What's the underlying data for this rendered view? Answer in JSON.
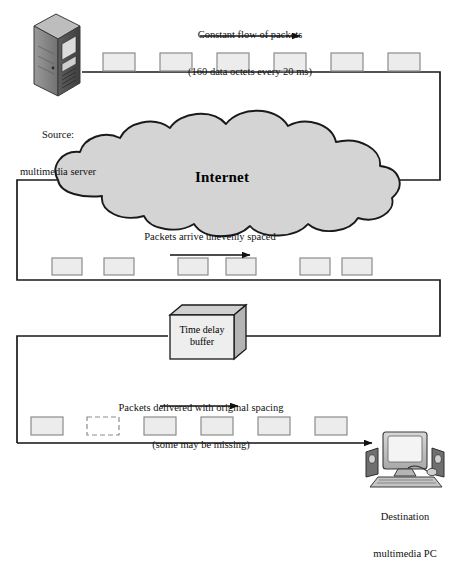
{
  "diagram": {
    "colors": {
      "line": "#1a1a1a",
      "packet_fill": "#ececec",
      "packet_stroke": "#808080",
      "cloud_fill": "#d4d4d4",
      "cloud_stroke": "#1a1a1a",
      "buffer_front": "#e8e8e8",
      "buffer_top": "#d0d0d0",
      "buffer_side": "#b8b8b8",
      "device_dark": "#4a4a4a",
      "device_mid": "#8a8a8a",
      "device_light": "#c9c9c9"
    }
  },
  "labels": {
    "top_caption_line1": "Constant flow of packets",
    "top_caption_line2": "(160 data octets every 20 ms)",
    "source_line1": "Source:",
    "source_line2": "multimedia server",
    "cloud": "Internet",
    "middle_caption": "Packets arrive unevenly spaced",
    "buffer_line1": "Time delay",
    "buffer_line2": "buffer",
    "bottom_caption_line1": "Packets delivered with original spacing",
    "bottom_caption_line2": "(some may be missing)",
    "destination_line1": "Destination",
    "destination_line2": "multimedia PC"
  },
  "packet_rows": {
    "top": {
      "name": "constant-flow-packets",
      "y": 53,
      "w": 32,
      "h": 18,
      "x_positions": [
        103,
        160,
        217,
        274,
        331,
        388
      ],
      "missing_index": null,
      "spacing": "even"
    },
    "middle": {
      "name": "unevenly-spaced-packets",
      "y": 258,
      "w": 30,
      "h": 17,
      "x_positions": [
        52,
        104,
        178,
        226,
        300,
        342
      ],
      "missing_index": null,
      "spacing": "uneven"
    },
    "bottom": {
      "name": "delivered-packets",
      "y": 417,
      "w": 32,
      "h": 18,
      "x_positions": [
        31,
        87,
        144,
        201,
        258,
        315
      ],
      "missing_index": 1,
      "spacing": "even"
    }
  },
  "arrows": [
    {
      "name": "top-flow-arrow",
      "x1": 200,
      "y1": 36,
      "x2": 300,
      "y2": 36
    },
    {
      "name": "middle-flow-arrow",
      "x1": 170,
      "y1": 255,
      "x2": 250,
      "y2": 255
    },
    {
      "name": "bottom-flow-arrow",
      "x1": 160,
      "y1": 406,
      "x2": 238,
      "y2": 406
    },
    {
      "name": "delivery-arrow-to-pc",
      "x1": 18,
      "y1": 443,
      "x2": 372,
      "y2": 443
    }
  ],
  "paths": {
    "source_to_internet": "from source, right along y=72 to x=440, down to y=180, into cloud right edge",
    "internet_to_buffer": "from cloud left edge x=60 y=180, left to x=17, down to y=280, right to x=440, down to y=336, left to buffer right face",
    "buffer_to_destination": "from buffer left face x=168 y=336, left to x=17, down to y=443, right to destination PC"
  },
  "cloud": {
    "cx": 230,
    "cy": 178,
    "left": 58,
    "right": 402,
    "top": 136,
    "bottom": 220
  },
  "buffer_box": {
    "x": 170,
    "y": 315,
    "w": 64,
    "h": 44
  },
  "server_icon": {
    "x": 32,
    "y": 14,
    "w": 48,
    "h": 80
  },
  "pc_icon": {
    "x": 366,
    "y": 432,
    "w": 82,
    "h": 50
  }
}
